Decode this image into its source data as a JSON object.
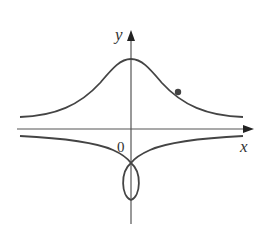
{
  "figure": {
    "type": "function-graph",
    "axes": {
      "x_label": "x",
      "y_label": "y",
      "origin_label": "0"
    },
    "colors": {
      "curve": "#444444",
      "axis": "#555555",
      "background": "#ffffff"
    },
    "curves": [
      {
        "name": "bell-curve",
        "description": "bell-shaped curve above x-axis with maximum on y-axis"
      },
      {
        "name": "lower-branches",
        "description": "two branches below x-axis meeting at a cusp on negative y-axis"
      },
      {
        "name": "loop",
        "description": "closed loop below cusp, symmetric about y-axis"
      }
    ],
    "marked_point": {
      "description": "point on right side of bell curve"
    }
  }
}
